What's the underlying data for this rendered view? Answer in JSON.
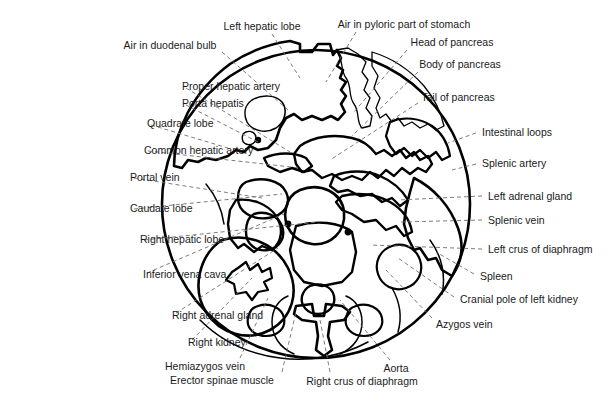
{
  "figure": {
    "shape": "circle",
    "colors": {
      "outline": "#000000",
      "leader_line": "#6e6e6e",
      "label_text": "#1a1a1a",
      "background": "#ffffff"
    },
    "circle": {
      "cx": 316,
      "cy": 204,
      "r": 154
    }
  },
  "labels": [
    {
      "id": "left-hepatic-lobe",
      "text": "Left hepatic lobe",
      "x": 262,
      "y": 26,
      "align": "center",
      "lx": 272,
      "ly": 34,
      "tx": 300,
      "ty": 78
    },
    {
      "id": "air-pyloric-stomach",
      "text": "Air in pyloric part of stomach",
      "x": 404,
      "y": 24,
      "align": "center",
      "lx": 356,
      "ly": 32,
      "tx": 326,
      "ty": 82
    },
    {
      "id": "air-duodenal-bulb",
      "text": "Air in duodenal bulb",
      "x": 170,
      "y": 45,
      "align": "center",
      "lx": 222,
      "ly": 52,
      "tx": 288,
      "ty": 110
    },
    {
      "id": "head-of-pancreas",
      "text": "Head of pancreas",
      "x": 452,
      "y": 42,
      "align": "center",
      "lx": 407,
      "ly": 50,
      "tx": 354,
      "ty": 112
    },
    {
      "id": "body-of-pancreas",
      "text": "Body of pancreas",
      "x": 460,
      "y": 64,
      "align": "center",
      "lx": 418,
      "ly": 72,
      "tx": 352,
      "ty": 136
    },
    {
      "id": "proper-hepatic-artery",
      "text": "Proper hepatic artery",
      "x": 182,
      "y": 86,
      "align": "right",
      "lx": 186,
      "ly": 88,
      "tx": 290,
      "ty": 152
    },
    {
      "id": "porta-hepatis",
      "text": "Porta hepatis",
      "x": 182,
      "y": 103,
      "align": "right",
      "lx": 186,
      "ly": 105,
      "tx": 258,
      "ty": 142
    },
    {
      "id": "tail-of-pancreas",
      "text": "Tail of pancreas",
      "x": 458,
      "y": 97,
      "align": "center",
      "lx": 418,
      "ly": 103,
      "tx": 330,
      "ty": 160
    },
    {
      "id": "quadrate-lobe",
      "text": "Quadrate lobe",
      "x": 147,
      "y": 123,
      "align": "right",
      "lx": 151,
      "ly": 125,
      "tx": 228,
      "ty": 148
    },
    {
      "id": "intestinal-loops",
      "text": "Intestinal loops",
      "x": 482,
      "y": 132,
      "align": "left",
      "lx": 476,
      "ly": 133,
      "tx": 448,
      "ty": 143
    },
    {
      "id": "common-hepatic-artery",
      "text": "Common hepatic artery",
      "x": 144,
      "y": 150,
      "align": "right",
      "lx": 148,
      "ly": 151,
      "tx": 300,
      "ty": 168
    },
    {
      "id": "splenic-artery",
      "text": "Splenic artery",
      "x": 482,
      "y": 163,
      "align": "left",
      "lx": 476,
      "ly": 164,
      "tx": 452,
      "ty": 170
    },
    {
      "id": "portal-vein",
      "text": "Portal vein",
      "x": 130,
      "y": 177,
      "align": "right",
      "lx": 134,
      "ly": 178,
      "tx": 262,
      "ty": 198
    },
    {
      "id": "left-adrenal-gland",
      "text": "Left adrenal gland",
      "x": 488,
      "y": 196,
      "align": "left",
      "lx": 482,
      "ly": 196,
      "tx": 398,
      "ty": 200
    },
    {
      "id": "caudate-lobe",
      "text": "Caudate lobe",
      "x": 130,
      "y": 208,
      "align": "right",
      "lx": 134,
      "ly": 209,
      "tx": 282,
      "ty": 194
    },
    {
      "id": "splenic-vein",
      "text": "Splenic vein",
      "x": 488,
      "y": 220,
      "align": "left",
      "lx": 482,
      "ly": 220,
      "tx": 400,
      "ty": 222
    },
    {
      "id": "right-hepatic-lobe",
      "text": "Right hepatic lobe",
      "x": 140,
      "y": 239,
      "align": "right",
      "lx": 144,
      "ly": 240,
      "tx": 318,
      "ty": 222
    },
    {
      "id": "left-crus-of-diaphragm",
      "text": "Left crus of diaphragm",
      "x": 488,
      "y": 249,
      "align": "left",
      "lx": 482,
      "ly": 249,
      "tx": 370,
      "ty": 245
    },
    {
      "id": "inferior-vena-cava",
      "text": "Inferior vena cava",
      "x": 143,
      "y": 274,
      "align": "right",
      "lx": 147,
      "ly": 273,
      "tx": 284,
      "ty": 214
    },
    {
      "id": "spleen",
      "text": "Spleen",
      "x": 480,
      "y": 276,
      "align": "left",
      "lx": 474,
      "ly": 274,
      "tx": 436,
      "ty": 252
    },
    {
      "id": "cranial-pole-left-kidney",
      "text": "Cranial pole of left kidney",
      "x": 460,
      "y": 299,
      "align": "left",
      "lx": 454,
      "ly": 297,
      "tx": 398,
      "ty": 258
    },
    {
      "id": "right-adrenal-gland",
      "text": "Right adrenal gland",
      "x": 172,
      "y": 315,
      "align": "right",
      "lx": 176,
      "ly": 313,
      "tx": 278,
      "ty": 248
    },
    {
      "id": "azygos-vein",
      "text": "Azygos vein",
      "x": 436,
      "y": 324,
      "align": "left",
      "lx": 432,
      "ly": 318,
      "tx": 386,
      "ty": 270
    },
    {
      "id": "right-kidney",
      "text": "Right kidney",
      "x": 188,
      "y": 342,
      "align": "right",
      "lx": 192,
      "ly": 340,
      "tx": 252,
      "ty": 278
    },
    {
      "id": "hemiazygos-vein",
      "text": "Hemiazygos vein",
      "x": 205,
      "y": 366,
      "align": "center",
      "lx": 240,
      "ly": 358,
      "tx": 268,
      "ty": 298
    },
    {
      "id": "aorta",
      "text": "Aorta",
      "x": 396,
      "y": 368,
      "align": "center",
      "lx": 390,
      "ly": 360,
      "tx": 340,
      "ty": 300
    },
    {
      "id": "erector-spinae-muscle",
      "text": "Erector spinae muscle",
      "x": 222,
      "y": 380,
      "align": "center",
      "lx": 282,
      "ly": 372,
      "tx": 296,
      "ty": 312
    },
    {
      "id": "right-crus-of-diaphragm",
      "text": "Right crus of diaphragm",
      "x": 362,
      "y": 381,
      "align": "center",
      "lx": 330,
      "ly": 372,
      "tx": 320,
      "ty": 320
    }
  ]
}
